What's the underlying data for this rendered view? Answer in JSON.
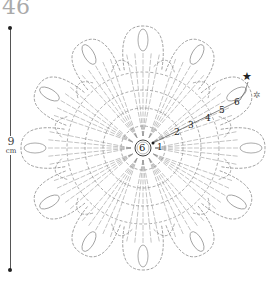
{
  "page_number": "46",
  "dimension": {
    "value": "9",
    "unit": "cm"
  },
  "center_label": "6",
  "round_numbers": [
    "1",
    "2",
    "3",
    "4",
    "5",
    "6"
  ],
  "markers": {
    "start_symbol": "★",
    "end_symbol": "✲"
  },
  "diagram": {
    "petals": 12,
    "line_color": "#888888"
  }
}
